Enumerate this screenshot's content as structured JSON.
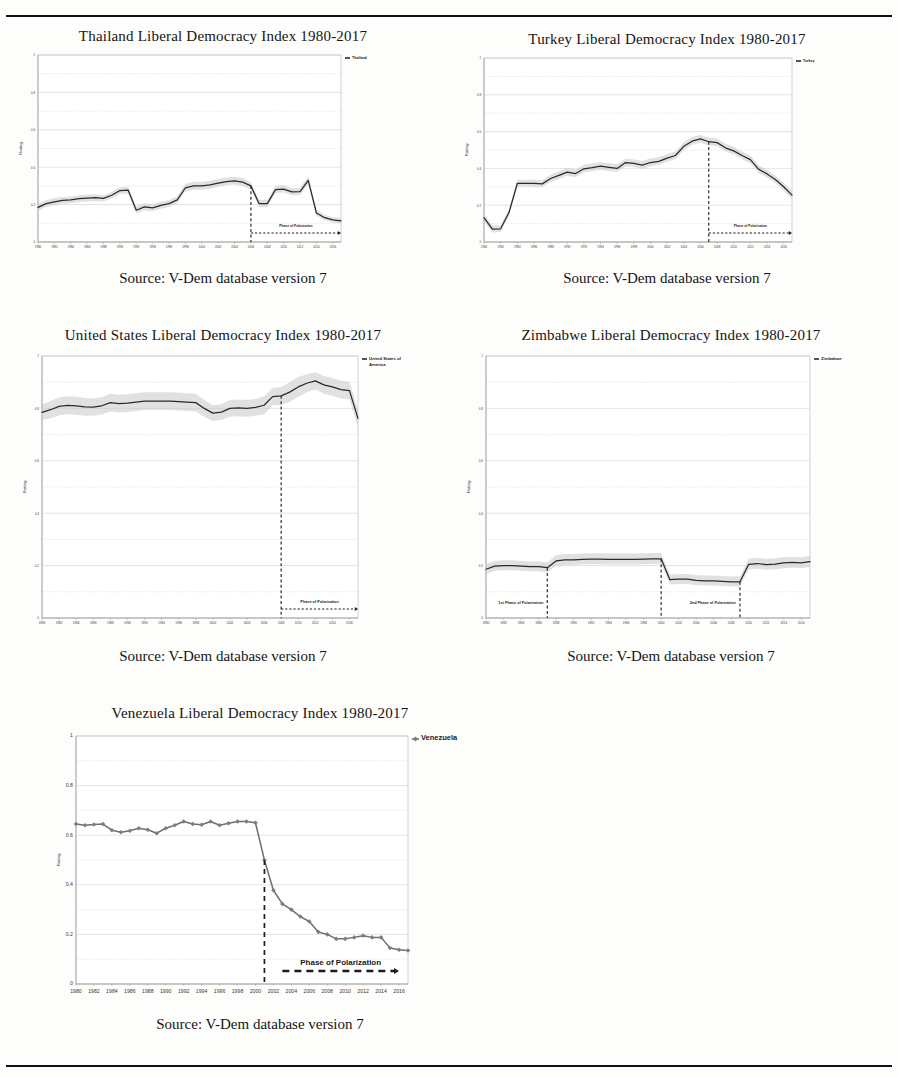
{
  "page": {
    "source_caption": "Source: V-Dem database version 7",
    "phase_label": "Phase of Polarization",
    "phase_label_1st": "1st Phase of Polarization",
    "phase_label_2nd": "2nd Phase of Polarization",
    "y_axis_label": "Rating",
    "rule_color": "#111111",
    "band_color": "#c8c8c8",
    "line_color": "#2a2a2a",
    "venezuela_line_color": "#6f6f6f"
  },
  "x_ticks": [
    "1980",
    "1982",
    "1984",
    "1986",
    "1988",
    "1990",
    "1992",
    "1994",
    "1996",
    "1998",
    "2000",
    "2002",
    "2004",
    "2006",
    "2008",
    "2010",
    "2012",
    "2014",
    "2016"
  ],
  "y_ticks": [
    "0",
    "0.2",
    "0.4",
    "0.6",
    "0.8",
    "1"
  ],
  "chart_data": [
    {
      "id": "thailand",
      "type": "line",
      "title": "Thailand Liberal Democracy Index 1980-2017",
      "xlabel": "",
      "ylabel": "Rating",
      "ylim": [
        0,
        1
      ],
      "xlim": [
        1980,
        2017
      ],
      "grid": true,
      "legend_position": "top-right",
      "legend": [
        "Thailand"
      ],
      "annotations": [
        {
          "text": "Phase of Polarization",
          "type": "phase-arrow",
          "start_year": 2006,
          "end_year": 2017
        }
      ],
      "vertical_markers": [
        2006
      ],
      "x": [
        1980,
        1981,
        1982,
        1983,
        1984,
        1985,
        1986,
        1987,
        1988,
        1989,
        1990,
        1991,
        1992,
        1993,
        1994,
        1995,
        1996,
        1997,
        1998,
        1999,
        2000,
        2001,
        2002,
        2003,
        2004,
        2005,
        2006,
        2007,
        2008,
        2009,
        2010,
        2011,
        2012,
        2013,
        2014,
        2015,
        2016,
        2017
      ],
      "values": [
        0.185,
        0.205,
        0.215,
        0.222,
        0.225,
        0.232,
        0.235,
        0.237,
        0.233,
        0.25,
        0.275,
        0.278,
        0.17,
        0.188,
        0.183,
        0.196,
        0.205,
        0.225,
        0.29,
        0.3,
        0.3,
        0.305,
        0.315,
        0.323,
        0.327,
        0.32,
        0.3,
        0.205,
        0.205,
        0.28,
        0.283,
        0.268,
        0.27,
        0.33,
        0.155,
        0.13,
        0.118,
        0.113
      ],
      "band_upper": [
        0.205,
        0.225,
        0.235,
        0.24,
        0.243,
        0.25,
        0.253,
        0.255,
        0.25,
        0.268,
        0.293,
        0.296,
        0.19,
        0.207,
        0.202,
        0.215,
        0.224,
        0.244,
        0.312,
        0.322,
        0.322,
        0.327,
        0.337,
        0.345,
        0.349,
        0.342,
        0.32,
        0.225,
        0.225,
        0.3,
        0.303,
        0.288,
        0.29,
        0.352,
        0.172,
        0.146,
        0.133,
        0.128
      ],
      "band_lower": [
        0.167,
        0.187,
        0.197,
        0.204,
        0.207,
        0.214,
        0.217,
        0.219,
        0.216,
        0.232,
        0.257,
        0.26,
        0.152,
        0.17,
        0.165,
        0.178,
        0.187,
        0.207,
        0.27,
        0.28,
        0.28,
        0.285,
        0.295,
        0.303,
        0.307,
        0.3,
        0.282,
        0.187,
        0.187,
        0.262,
        0.265,
        0.25,
        0.252,
        0.31,
        0.14,
        0.116,
        0.104,
        0.099
      ]
    },
    {
      "id": "turkey",
      "type": "line",
      "title": "Turkey Liberal Democracy Index 1980-2017",
      "xlabel": "",
      "ylabel": "Rating",
      "ylim": [
        0,
        1
      ],
      "xlim": [
        1980,
        2017
      ],
      "grid": true,
      "legend_position": "top-right",
      "legend": [
        "Turkey"
      ],
      "annotations": [
        {
          "text": "Phase of Polarization",
          "type": "phase-arrow",
          "start_year": 2007,
          "end_year": 2017
        }
      ],
      "vertical_markers": [
        2007
      ],
      "x": [
        1980,
        1981,
        1982,
        1983,
        1984,
        1985,
        1986,
        1987,
        1988,
        1989,
        1990,
        1991,
        1992,
        1993,
        1994,
        1995,
        1996,
        1997,
        1998,
        1999,
        2000,
        2001,
        2002,
        2003,
        2004,
        2005,
        2006,
        2007,
        2008,
        2009,
        2010,
        2011,
        2012,
        2013,
        2014,
        2015,
        2016,
        2017
      ],
      "values": [
        0.132,
        0.07,
        0.072,
        0.16,
        0.318,
        0.318,
        0.318,
        0.316,
        0.345,
        0.362,
        0.38,
        0.372,
        0.398,
        0.404,
        0.412,
        0.406,
        0.4,
        0.432,
        0.427,
        0.418,
        0.432,
        0.438,
        0.456,
        0.47,
        0.52,
        0.548,
        0.56,
        0.545,
        0.54,
        0.512,
        0.495,
        0.47,
        0.448,
        0.395,
        0.37,
        0.34,
        0.3,
        0.255,
        0.135
      ],
      "band_upper": [
        0.152,
        0.09,
        0.092,
        0.18,
        0.338,
        0.338,
        0.338,
        0.336,
        0.366,
        0.384,
        0.402,
        0.394,
        0.42,
        0.426,
        0.434,
        0.428,
        0.422,
        0.454,
        0.449,
        0.44,
        0.454,
        0.46,
        0.478,
        0.492,
        0.542,
        0.57,
        0.582,
        0.567,
        0.562,
        0.534,
        0.517,
        0.492,
        0.47,
        0.417,
        0.392,
        0.362,
        0.322,
        0.277,
        0.155
      ],
      "band_lower": [
        0.114,
        0.052,
        0.054,
        0.142,
        0.3,
        0.3,
        0.3,
        0.298,
        0.326,
        0.342,
        0.36,
        0.352,
        0.378,
        0.384,
        0.392,
        0.386,
        0.38,
        0.412,
        0.407,
        0.398,
        0.412,
        0.418,
        0.436,
        0.45,
        0.5,
        0.528,
        0.54,
        0.525,
        0.52,
        0.492,
        0.475,
        0.45,
        0.428,
        0.375,
        0.35,
        0.32,
        0.28,
        0.235,
        0.117
      ]
    },
    {
      "id": "united-states",
      "type": "line",
      "title": "United States Liberal Democracy Index 1980-2017",
      "xlabel": "",
      "ylabel": "Rating",
      "ylim": [
        0,
        1
      ],
      "xlim": [
        1980,
        2017
      ],
      "grid": true,
      "legend_position": "top-right",
      "legend": [
        "United States of America"
      ],
      "annotations": [
        {
          "text": "Phase of Polarization",
          "type": "phase-arrow",
          "start_year": 2008,
          "end_year": 2017
        }
      ],
      "vertical_markers": [
        2008
      ],
      "x": [
        1980,
        1981,
        1982,
        1983,
        1984,
        1985,
        1986,
        1987,
        1988,
        1989,
        1990,
        1991,
        1992,
        1993,
        1994,
        1995,
        1996,
        1997,
        1998,
        1999,
        2000,
        2001,
        2002,
        2003,
        2004,
        2005,
        2006,
        2007,
        2008,
        2009,
        2010,
        2011,
        2012,
        2013,
        2014,
        2015,
        2016,
        2017
      ],
      "values": [
        0.785,
        0.795,
        0.808,
        0.812,
        0.81,
        0.806,
        0.805,
        0.81,
        0.822,
        0.818,
        0.82,
        0.824,
        0.828,
        0.828,
        0.828,
        0.828,
        0.826,
        0.824,
        0.822,
        0.8,
        0.782,
        0.786,
        0.8,
        0.802,
        0.8,
        0.804,
        0.812,
        0.845,
        0.848,
        0.862,
        0.882,
        0.896,
        0.905,
        0.89,
        0.882,
        0.872,
        0.868,
        0.762
      ],
      "band_upper": [
        0.815,
        0.828,
        0.842,
        0.846,
        0.844,
        0.84,
        0.838,
        0.843,
        0.856,
        0.852,
        0.854,
        0.858,
        0.862,
        0.862,
        0.862,
        0.862,
        0.86,
        0.858,
        0.856,
        0.832,
        0.812,
        0.816,
        0.832,
        0.834,
        0.832,
        0.836,
        0.846,
        0.878,
        0.882,
        0.9,
        0.92,
        0.93,
        0.938,
        0.924,
        0.916,
        0.906,
        0.902,
        0.796
      ],
      "band_lower": [
        0.755,
        0.762,
        0.774,
        0.778,
        0.776,
        0.772,
        0.772,
        0.777,
        0.788,
        0.784,
        0.786,
        0.79,
        0.794,
        0.794,
        0.794,
        0.794,
        0.792,
        0.79,
        0.788,
        0.768,
        0.752,
        0.756,
        0.768,
        0.77,
        0.768,
        0.772,
        0.778,
        0.812,
        0.814,
        0.824,
        0.844,
        0.862,
        0.872,
        0.856,
        0.848,
        0.838,
        0.834,
        0.728
      ]
    },
    {
      "id": "zimbabwe",
      "type": "line",
      "title": "Zimbabwe Liberal Democracy Index 1980-2017",
      "xlabel": "",
      "ylabel": "Rating",
      "ylim": [
        0,
        1
      ],
      "xlim": [
        1980,
        2017
      ],
      "grid": true,
      "legend_position": "top-right",
      "legend": [
        "Zimbabwe"
      ],
      "annotations": [
        {
          "text": "1st Phase of Polarization",
          "type": "phase-label",
          "end_year": 1987
        },
        {
          "text": "2nd Phase of Polarization",
          "type": "phase-label",
          "end_year": 2009
        }
      ],
      "vertical_markers": [
        1987,
        2000,
        2009
      ],
      "x": [
        1980,
        1981,
        1982,
        1983,
        1984,
        1985,
        1986,
        1987,
        1988,
        1989,
        1990,
        1991,
        1992,
        1993,
        1994,
        1995,
        1996,
        1997,
        1998,
        1999,
        2000,
        2001,
        2002,
        2003,
        2004,
        2005,
        2006,
        2007,
        2008,
        2009,
        2010,
        2011,
        2012,
        2013,
        2014,
        2015,
        2016,
        2017
      ],
      "values": [
        0.186,
        0.198,
        0.2,
        0.2,
        0.198,
        0.196,
        0.196,
        0.192,
        0.218,
        0.222,
        0.222,
        0.224,
        0.225,
        0.225,
        0.224,
        0.224,
        0.224,
        0.224,
        0.225,
        0.226,
        0.226,
        0.146,
        0.148,
        0.148,
        0.144,
        0.142,
        0.142,
        0.14,
        0.138,
        0.138,
        0.205,
        0.208,
        0.204,
        0.206,
        0.21,
        0.212,
        0.21,
        0.215
      ],
      "band_upper": [
        0.206,
        0.218,
        0.22,
        0.22,
        0.218,
        0.216,
        0.216,
        0.212,
        0.24,
        0.244,
        0.244,
        0.246,
        0.247,
        0.247,
        0.246,
        0.246,
        0.246,
        0.246,
        0.247,
        0.248,
        0.248,
        0.166,
        0.168,
        0.168,
        0.164,
        0.162,
        0.162,
        0.16,
        0.158,
        0.158,
        0.226,
        0.23,
        0.226,
        0.228,
        0.232,
        0.234,
        0.232,
        0.237
      ],
      "band_lower": [
        0.168,
        0.18,
        0.182,
        0.182,
        0.18,
        0.178,
        0.178,
        0.174,
        0.198,
        0.202,
        0.202,
        0.204,
        0.205,
        0.205,
        0.204,
        0.204,
        0.204,
        0.204,
        0.205,
        0.206,
        0.206,
        0.128,
        0.13,
        0.13,
        0.126,
        0.124,
        0.124,
        0.122,
        0.12,
        0.12,
        0.186,
        0.188,
        0.184,
        0.186,
        0.19,
        0.192,
        0.19,
        0.195
      ]
    },
    {
      "id": "venezuela",
      "type": "line",
      "title": "Venezuela Liberal Democracy Index 1980-2017",
      "xlabel": "",
      "ylabel": "Rating",
      "ylim": [
        0,
        1
      ],
      "xlim": [
        1980,
        2017
      ],
      "grid": true,
      "legend_position": "top-right",
      "legend": [
        "Venezuela"
      ],
      "markers": true,
      "annotations": [
        {
          "text": "Phase of Polarization",
          "type": "phase-arrow",
          "start_year": 2003,
          "end_year": 2016
        }
      ],
      "vertical_markers": [
        2001
      ],
      "x": [
        1980,
        1981,
        1982,
        1983,
        1984,
        1985,
        1986,
        1987,
        1988,
        1989,
        1990,
        1991,
        1992,
        1993,
        1994,
        1995,
        1996,
        1997,
        1998,
        1999,
        2000,
        2001,
        2002,
        2003,
        2004,
        2005,
        2006,
        2007,
        2008,
        2009,
        2010,
        2011,
        2012,
        2013,
        2014,
        2015,
        2016,
        2017
      ],
      "values": [
        0.645,
        0.64,
        0.643,
        0.645,
        0.62,
        0.612,
        0.618,
        0.628,
        0.622,
        0.608,
        0.628,
        0.64,
        0.655,
        0.645,
        0.642,
        0.655,
        0.64,
        0.648,
        0.655,
        0.655,
        0.65,
        0.5,
        0.378,
        0.323,
        0.3,
        0.272,
        0.252,
        0.21,
        0.2,
        0.182,
        0.182,
        0.188,
        0.195,
        0.188,
        0.188,
        0.145,
        0.138,
        0.135
      ]
    }
  ],
  "panels": [
    {
      "id": "thailand",
      "title_text": "Thailand Liberal Democracy Index 1980-2017"
    },
    {
      "id": "turkey",
      "title_text": "Turkey Liberal Democracy Index 1980-2017"
    },
    {
      "id": "united-states",
      "title_text": "United States Liberal Democracy Index 1980-2017"
    },
    {
      "id": "zimbabwe",
      "title_text": "Zimbabwe Liberal Democracy Index 1980-2017"
    },
    {
      "id": "venezuela",
      "title_text": "Venezuela Liberal Democracy Index 1980-2017"
    }
  ]
}
